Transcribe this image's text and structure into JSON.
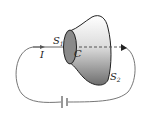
{
  "diagram": {
    "labels": {
      "surface1": "S",
      "surface1_sub": "1",
      "surface2": "S",
      "surface2_sub": "2",
      "curve": "C",
      "current": "I"
    },
    "colors": {
      "wire": "#555555",
      "surface_dark": "#7a7a7a",
      "surface_light": "#e8e8e8",
      "outline": "#222222"
    }
  }
}
